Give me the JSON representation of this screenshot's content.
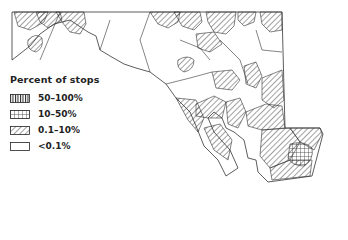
{
  "map": {
    "region": "Maryland",
    "stroke_color": "#333333",
    "fill_color": "#ffffff"
  },
  "legend": {
    "title": "Percent of stops",
    "items": [
      {
        "label": "50–100%",
        "pattern": "vertical-lines"
      },
      {
        "label": "10–50%",
        "pattern": "grid"
      },
      {
        "label": "0.1–10%",
        "pattern": "diagonal-lines"
      },
      {
        "label": "<0.1%",
        "pattern": "empty"
      }
    ]
  }
}
